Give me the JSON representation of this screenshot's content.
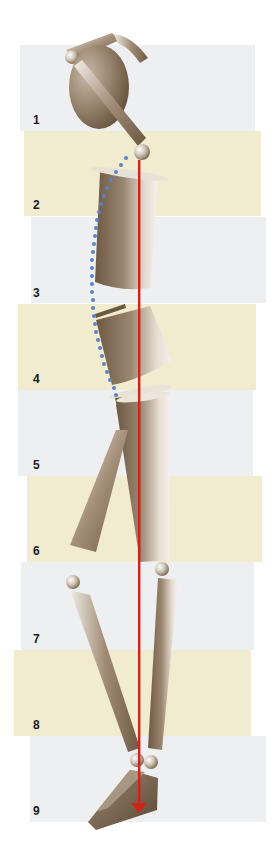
{
  "diagram": {
    "type": "posture-segment-diagram",
    "colors": {
      "band_gray": "#eeeff0",
      "band_cream": "#f1ebd0",
      "plumb_line": "#d2231a",
      "spine_dots": "#5b84c4",
      "figure_dark": "#6e5a44",
      "figure_light": "#f2ede6",
      "label": "#1b1b1b"
    },
    "bands": [
      {
        "label": "1",
        "tone": "gray",
        "x": 20,
        "y": 45,
        "w": 235,
        "h": 86,
        "label_x": 33,
        "label_y": 113
      },
      {
        "label": "2",
        "tone": "cream",
        "x": 24,
        "y": 131,
        "w": 237,
        "h": 85,
        "label_x": 33,
        "label_y": 198
      },
      {
        "label": "3",
        "tone": "gray",
        "x": 31,
        "y": 217,
        "w": 235,
        "h": 86,
        "label_x": 33,
        "label_y": 286
      },
      {
        "label": "4",
        "tone": "cream",
        "x": 18,
        "y": 304,
        "w": 238,
        "h": 86,
        "label_x": 33,
        "label_y": 372
      },
      {
        "label": "5",
        "tone": "gray",
        "x": 18,
        "y": 390,
        "w": 235,
        "h": 86,
        "label_x": 33,
        "label_y": 458
      },
      {
        "label": "6",
        "tone": "cream",
        "x": 27,
        "y": 476,
        "w": 235,
        "h": 86,
        "label_x": 33,
        "label_y": 544
      },
      {
        "label": "7",
        "tone": "gray",
        "x": 21,
        "y": 562,
        "w": 233,
        "h": 88,
        "label_x": 33,
        "label_y": 632
      },
      {
        "label": "8",
        "tone": "cream",
        "x": 14,
        "y": 650,
        "w": 237,
        "h": 86,
        "label_x": 33,
        "label_y": 718
      },
      {
        "label": "9",
        "tone": "gray",
        "x": 30,
        "y": 736,
        "w": 236,
        "h": 86,
        "label_x": 33,
        "label_y": 804
      }
    ],
    "plumb_line": {
      "x": 139,
      "y_start": 160,
      "y_end": 812,
      "arrow": "down"
    }
  }
}
